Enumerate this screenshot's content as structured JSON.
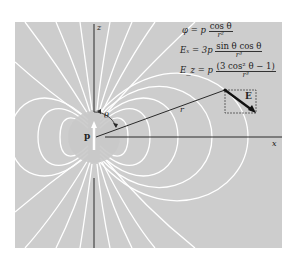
{
  "figure": {
    "background": "#ffffff",
    "panel_color": "#cdcdcd",
    "field_line_color": "#ffffff",
    "axis_color": "#2a2a2a",
    "labels": {
      "z_axis": "z",
      "x_axis": "x",
      "dipole": "p",
      "angle": "θ",
      "radius": "r",
      "field": "E"
    },
    "equations": {
      "phi": {
        "lhs": "φ = p",
        "num": "cos θ",
        "den": "r²"
      },
      "Ex": {
        "lhs": "Eₓ = 3p",
        "num": "sin θ cos θ",
        "den": "r³"
      },
      "Ez": {
        "lhs": "E_z = p",
        "num": "(3 cos² θ − 1)",
        "den": "r³"
      }
    }
  }
}
